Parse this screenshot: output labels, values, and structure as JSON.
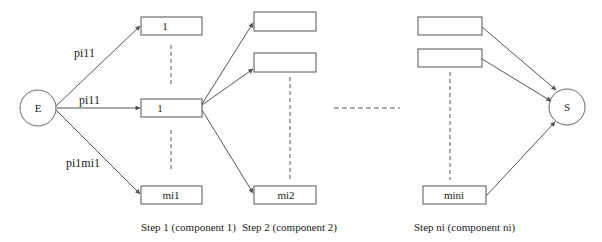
{
  "nodes": {
    "entry": {
      "label": "E"
    },
    "sink": {
      "label": "S"
    }
  },
  "edge_labels": {
    "top": "pi11",
    "middle": "pi11",
    "bottom": "pi1mi1"
  },
  "steps": [
    {
      "caption": "Step 1 (component 1)",
      "boxes": [
        "1",
        "1",
        "mi1"
      ]
    },
    {
      "caption": "Step 2 (component 2)",
      "boxes": [
        "",
        "",
        "mi2"
      ]
    },
    {
      "caption": "Step ni (component ni)",
      "boxes": [
        "",
        "",
        "mini"
      ]
    }
  ],
  "colors": {
    "stroke": "#444444",
    "text": "#222222",
    "background": "#ffffff"
  }
}
